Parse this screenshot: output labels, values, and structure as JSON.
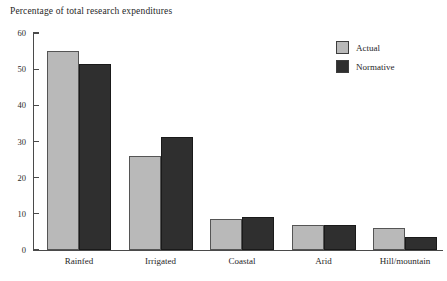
{
  "chart_data": {
    "type": "bar",
    "title": "Percentage of total research expenditures",
    "xlabel": "",
    "ylabel": "",
    "ylim": [
      0,
      60
    ],
    "yticks": [
      0,
      10,
      20,
      30,
      40,
      50,
      60
    ],
    "grid": false,
    "legend_position": "top-right",
    "categories": [
      "Rainfed",
      "Irrigated",
      "Coastal",
      "Arid",
      "Hill/mountain"
    ],
    "series": [
      {
        "name": "Actual",
        "color": "#b9b9b9",
        "values": [
          55,
          26,
          8.5,
          7,
          6
        ]
      },
      {
        "name": "Normative",
        "color": "#2f2f2f",
        "values": [
          51.5,
          31.3,
          9.2,
          7,
          3.5
        ]
      }
    ]
  }
}
